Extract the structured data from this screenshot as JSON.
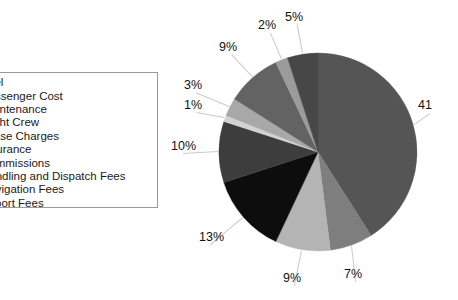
{
  "chart_data": {
    "type": "pie",
    "title": "",
    "categories": [
      "Fuel",
      "Passenger Cost",
      "Maintenance",
      "Flight Crew",
      "Lease Charges",
      "Insurance",
      "Commissions",
      "Handling and Dispatch Fees",
      "Navigation Fees",
      "Airport Fees"
    ],
    "values": [
      41,
      7,
      9,
      13,
      10,
      1,
      3,
      9,
      2,
      5
    ],
    "labels": [
      "41",
      "7%",
      "9%",
      "13%",
      "10%",
      "1%",
      "3%",
      "9%",
      "2%",
      "5%"
    ],
    "colors": [
      "#555555",
      "#7e7e7e",
      "#b4b4b4",
      "#0d0d0d",
      "#3d3d3d",
      "#d3d3d3",
      "#a8a8a8",
      "#636363",
      "#9b9b9b",
      "#474747"
    ],
    "start_angle": 0,
    "direction": "clockwise",
    "legend_position": "left",
    "grid": false,
    "xlabel": "",
    "ylabel": ""
  },
  "legend": {
    "items": [
      {
        "label": "Fuel",
        "color": "#555555"
      },
      {
        "label": "Passenger Cost",
        "color": "#7e7e7e"
      },
      {
        "label": "Maintenance",
        "color": "#b4b4b4"
      },
      {
        "label": "Flight Crew",
        "color": "#0d0d0d"
      },
      {
        "label": "Lease Charges",
        "color": "#3d3d3d"
      },
      {
        "label": "Insurance",
        "color": "#d3d3d3"
      },
      {
        "label": "Commissions",
        "color": "#a8a8a8"
      },
      {
        "label": "Handling and Dispatch Fees",
        "color": "#636363"
      },
      {
        "label": "Navigation Fees",
        "color": "#9b9b9b"
      },
      {
        "label": "Airport Fees",
        "color": "#474747"
      }
    ]
  },
  "value_labels": [
    {
      "text": "41",
      "left": 418,
      "top": 99
    },
    {
      "text": "7%",
      "left": 344,
      "top": 268
    },
    {
      "text": "9%",
      "left": 283,
      "top": 272
    },
    {
      "text": "13%",
      "left": 199,
      "top": 231
    },
    {
      "text": "10%",
      "left": 171,
      "top": 140
    },
    {
      "text": "1%",
      "left": 184,
      "top": 99
    },
    {
      "text": "3%",
      "left": 184,
      "top": 79
    },
    {
      "text": "9%",
      "left": 219,
      "top": 41
    },
    {
      "text": "2%",
      "left": 258,
      "top": 19
    },
    {
      "text": "5%",
      "left": 285,
      "top": 11
    }
  ]
}
